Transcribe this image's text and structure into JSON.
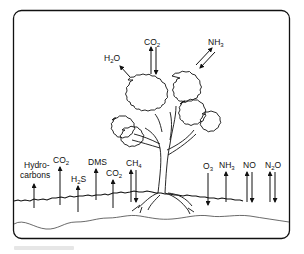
{
  "diagram": {
    "canopy_fluxes": [
      {
        "id": "h2o",
        "base": "H",
        "sub": "2",
        "rest": "O",
        "direction": "up"
      },
      {
        "id": "co2",
        "base": "CO",
        "sub": "2",
        "rest": "",
        "direction": "both"
      },
      {
        "id": "nh3",
        "base": "NH",
        "sub": "3",
        "rest": "",
        "direction": "both"
      }
    ],
    "soil_fluxes": [
      {
        "id": "hydrocarbons",
        "line1": "Hydro-",
        "line2": "carbons",
        "direction": "up"
      },
      {
        "id": "co2-a",
        "base": "CO",
        "sub": "2",
        "rest": "",
        "direction": "up"
      },
      {
        "id": "h2s",
        "base": "H",
        "sub": "2",
        "rest": "S",
        "direction": "up"
      },
      {
        "id": "dms",
        "base": "DMS",
        "sub": "",
        "rest": "",
        "direction": "up"
      },
      {
        "id": "co2-b",
        "base": "CO",
        "sub": "2",
        "rest": "",
        "direction": "up"
      },
      {
        "id": "ch4",
        "base": "CH",
        "sub": "4",
        "rest": "",
        "direction": "both"
      },
      {
        "id": "o3",
        "base": "O",
        "sub": "3",
        "rest": "",
        "direction": "down"
      },
      {
        "id": "nh3-soil",
        "base": "NH",
        "sub": "3",
        "rest": "",
        "direction": "up"
      },
      {
        "id": "no",
        "base": "NO",
        "sub": "",
        "rest": "",
        "direction": "both"
      },
      {
        "id": "n2o",
        "base": "N",
        "sub": "2",
        "rest": "O",
        "direction": "both"
      }
    ],
    "colors": {
      "line": "#111111",
      "background": "#ffffff"
    }
  }
}
